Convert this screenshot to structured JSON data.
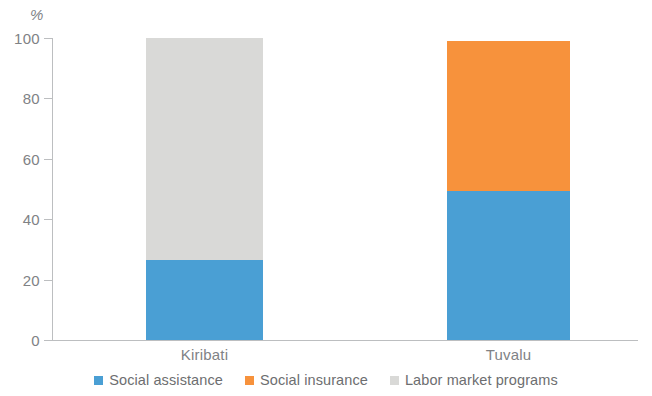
{
  "chart_data": {
    "type": "bar",
    "subtype": "stacked-100",
    "title": "",
    "xlabel": "",
    "ylabel": "",
    "unit_label": "%",
    "categories": [
      "Kiribati",
      "Tuvalu"
    ],
    "series": [
      {
        "name": "Social assistance",
        "color": "#4a9fd4",
        "values": [
          26.5,
          49.3
        ]
      },
      {
        "name": "Social insurance",
        "color": "#f7923c",
        "values": [
          0,
          49.7
        ]
      },
      {
        "name": "Labor market programs",
        "color": "#d9d9d7",
        "values": [
          73.5,
          0
        ]
      }
    ],
    "ylim": [
      0,
      100
    ],
    "yticks": [
      0,
      20,
      40,
      60,
      80,
      100
    ],
    "ytick_labels": [
      "0",
      "20",
      "40",
      "60",
      "80",
      "100"
    ],
    "grid": false,
    "legend_position": "bottom"
  },
  "axis": {
    "unit": "%",
    "tick_labels": [
      "100",
      "80",
      "60",
      "40",
      "20",
      "0"
    ]
  },
  "categories": [
    {
      "label": "Kiribati"
    },
    {
      "label": "Tuvalu"
    }
  ],
  "legend": {
    "items": [
      {
        "label": "Social assistance",
        "color": "#4a9fd4"
      },
      {
        "label": "Social insurance",
        "color": "#f7923c"
      },
      {
        "label": "Labor market programs",
        "color": "#d9d9d7"
      }
    ]
  }
}
